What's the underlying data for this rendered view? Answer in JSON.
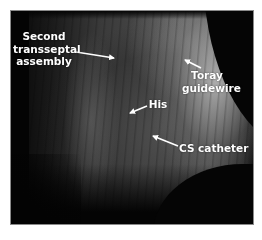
{
  "figure": {
    "type": "fluoroscopic image",
    "frame_color": "#050505",
    "label_color": "#ffffff",
    "labels": {
      "transseptal": {
        "lines": [
          "Second",
          "transseptal",
          "assembly"
        ]
      },
      "toray": {
        "lines": [
          "Toray",
          "guidewire"
        ]
      },
      "his": {
        "lines": [
          "His"
        ]
      },
      "cs": {
        "lines": [
          "CS catheter"
        ]
      }
    },
    "arrows": [
      {
        "name": "transseptal-arrow",
        "from": [
          76,
          52
        ],
        "to": [
          114,
          58
        ]
      },
      {
        "name": "toray-arrow",
        "from": [
          201,
          68
        ],
        "to": [
          185,
          60
        ]
      },
      {
        "name": "his-arrow",
        "from": [
          147,
          106
        ],
        "to": [
          130,
          113
        ]
      },
      {
        "name": "cs-arrow",
        "from": [
          178,
          146
        ],
        "to": [
          153,
          136
        ]
      }
    ]
  }
}
